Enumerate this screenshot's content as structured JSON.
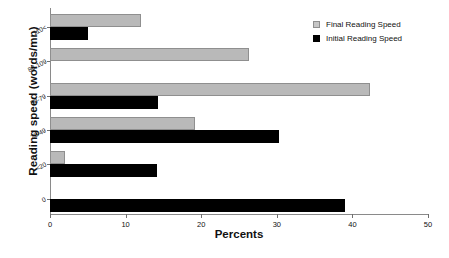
{
  "chart_data": {
    "type": "bar",
    "orientation": "horizontal",
    "title": "",
    "xlabel": "Percents",
    "ylabel": "Reading speed (words/mn)",
    "categories": [
      "110<",
      "80-109",
      "50-79",
      "20-49",
      "<20",
      "0"
    ],
    "series": [
      {
        "name": "Final Reading Speed",
        "color": "#b9b9b9",
        "values": [
          12,
          26.3,
          42.3,
          19.2,
          2,
          0
        ]
      },
      {
        "name": "Initial Reading Speed",
        "color": "#000000",
        "values": [
          5,
          0,
          14.3,
          30.3,
          14.2,
          39
        ]
      }
    ],
    "xlim": [
      0,
      50
    ],
    "xticks": [
      0,
      10,
      20,
      30,
      40,
      50
    ],
    "grid": false,
    "legend_position": "top-right"
  },
  "legend": {
    "entries": [
      {
        "label": "Final Reading Speed"
      },
      {
        "label": "Initial Reading Speed"
      }
    ]
  }
}
